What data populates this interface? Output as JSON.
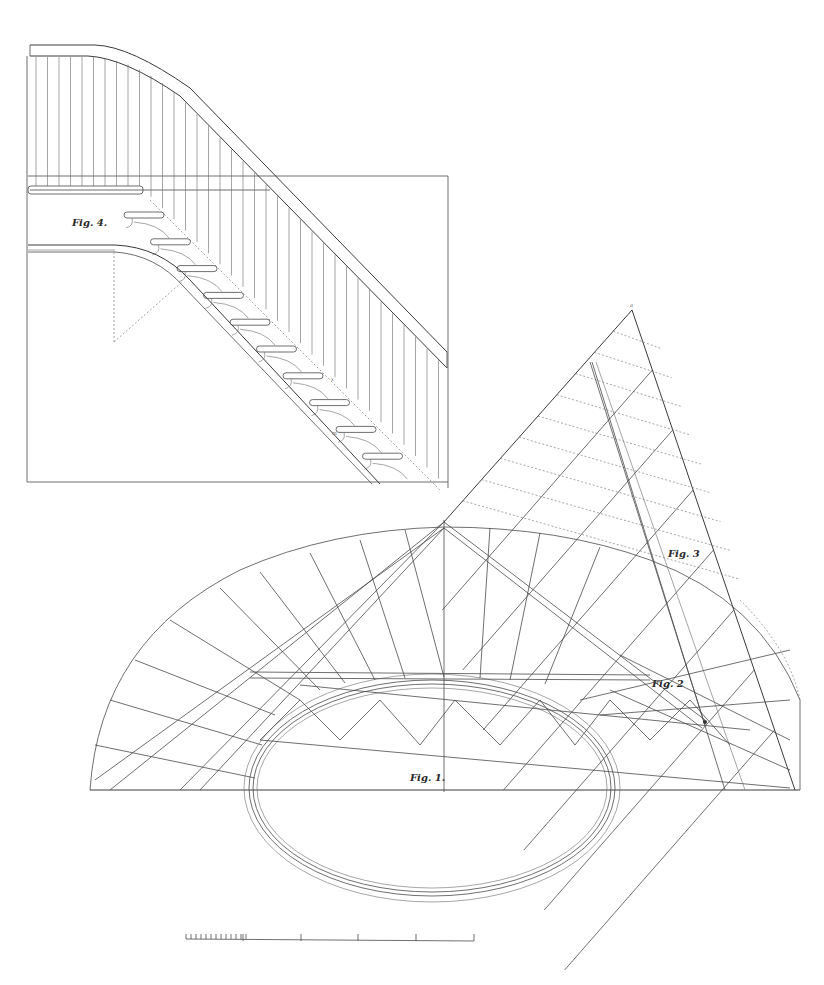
{
  "plate": {
    "subject": "Elliptical staircase construction plate",
    "ink_color": "#4a4a4a",
    "paper_color": "#ffffff"
  },
  "figures": [
    {
      "id": "fig4",
      "label": "Fig. 4.",
      "description": "Elevation of staircase with balusters and handrail"
    },
    {
      "id": "fig3",
      "label": "Fig. 3",
      "description": "Development of the stringer / wreath"
    },
    {
      "id": "fig2",
      "label": "Fig. 2",
      "description": "Detail of tread projections"
    },
    {
      "id": "fig1",
      "label": "Fig. 1.",
      "description": "Plan of elliptical staircase with winders"
    }
  ],
  "point_labels": {
    "apex": "a",
    "left_edge": [
      "8",
      "7",
      "6",
      "5",
      "4",
      "3",
      "2"
    ],
    "right_edge": [
      "a",
      "b",
      "c",
      "d",
      "e",
      "f"
    ]
  },
  "scale_bar": {
    "fine_divisions": 12,
    "major_divisions": 4
  }
}
